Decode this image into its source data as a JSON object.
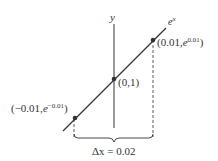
{
  "diagram": {
    "axis_label": "y",
    "curve_label_base": "e",
    "curve_label_exp": "x",
    "points": [
      {
        "name": "left",
        "x_text": "(−0.01,",
        "e": "e",
        "exp": "−0.01",
        "close": ")"
      },
      {
        "name": "center",
        "text": "(0,1)"
      },
      {
        "name": "right",
        "x_text": "(0.01,",
        "e": "e",
        "exp": "0.01",
        "close": ")"
      }
    ],
    "interval_label": "Δx = 0.02",
    "colors": {
      "line": "#333333",
      "dot": "#333333"
    }
  }
}
